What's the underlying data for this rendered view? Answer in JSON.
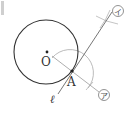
{
  "diagram": {
    "type": "geometric-construction",
    "colors": {
      "circle": "#333333",
      "construction": "#aaaaaa",
      "tangent_line": "#666666",
      "label": "#333333",
      "corner_mark": "#cfcfcf"
    },
    "points": {
      "O": {
        "label": "O",
        "x": 47,
        "y": 52
      },
      "A": {
        "label": "A",
        "x": 72,
        "y": 71
      }
    },
    "circle": {
      "center": "O",
      "cx": 46,
      "cy": 52,
      "r": 32
    },
    "labels": {
      "center": "O",
      "tangent_point": "A",
      "line": "ℓ",
      "mark_a": "ア",
      "mark_i": "イ"
    }
  }
}
